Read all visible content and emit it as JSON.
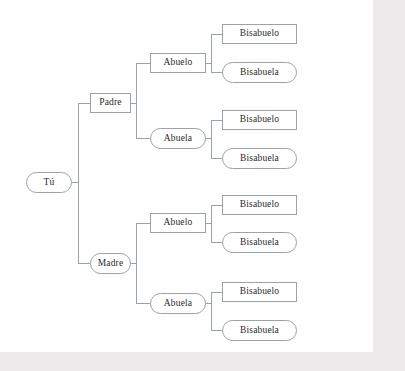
{
  "diagram": {
    "type": "family-tree",
    "language": "es",
    "orientation": "left-to-right",
    "generations": 4,
    "shape_legend": {
      "rectangle": "masculino",
      "stadium": "femenino"
    },
    "colors": {
      "page_background": "#fefefe",
      "outer_background": "#eceaea",
      "node_border": "#9aa3ac",
      "node_fill": "#ffffff",
      "edge": "#9aa3ac",
      "text": "#2b2b2b"
    }
  },
  "nodes": {
    "root": {
      "label": "Tú",
      "shape": "stadium",
      "gender": "neutral",
      "generation": 0
    },
    "padre": {
      "label": "Padre",
      "shape": "rectangle",
      "gender": "male",
      "generation": 1
    },
    "madre": {
      "label": "Madre",
      "shape": "stadium",
      "gender": "female",
      "generation": 1
    },
    "abuelo_paterno": {
      "label": "Abuelo",
      "shape": "rectangle",
      "gender": "male",
      "generation": 2
    },
    "abuela_paterna": {
      "label": "Abuela",
      "shape": "stadium",
      "gender": "female",
      "generation": 2
    },
    "abuelo_materno": {
      "label": "Abuelo",
      "shape": "rectangle",
      "gender": "male",
      "generation": 2
    },
    "abuela_materna": {
      "label": "Abuela",
      "shape": "stadium",
      "gender": "female",
      "generation": 2
    },
    "bisabuelo_1": {
      "label": "Bisabuelo",
      "shape": "rectangle",
      "gender": "male",
      "generation": 3
    },
    "bisabuela_1": {
      "label": "Bisabuela",
      "shape": "stadium",
      "gender": "female",
      "generation": 3
    },
    "bisabuelo_2": {
      "label": "Bisabuelo",
      "shape": "rectangle",
      "gender": "male",
      "generation": 3
    },
    "bisabuela_2": {
      "label": "Bisabuela",
      "shape": "stadium",
      "gender": "female",
      "generation": 3
    },
    "bisabuelo_3": {
      "label": "Bisabuelo",
      "shape": "rectangle",
      "gender": "male",
      "generation": 3
    },
    "bisabuela_3": {
      "label": "Bisabuela",
      "shape": "stadium",
      "gender": "female",
      "generation": 3
    },
    "bisabuelo_4": {
      "label": "Bisabuelo",
      "shape": "rectangle",
      "gender": "male",
      "generation": 3
    },
    "bisabuela_4": {
      "label": "Bisabuela",
      "shape": "stadium",
      "gender": "female",
      "generation": 3
    }
  },
  "edges": [
    {
      "from": "root",
      "to": "padre"
    },
    {
      "from": "root",
      "to": "madre"
    },
    {
      "from": "padre",
      "to": "abuelo_paterno"
    },
    {
      "from": "padre",
      "to": "abuela_paterna"
    },
    {
      "from": "madre",
      "to": "abuelo_materno"
    },
    {
      "from": "madre",
      "to": "abuela_materna"
    },
    {
      "from": "abuelo_paterno",
      "to": "bisabuelo_1"
    },
    {
      "from": "abuelo_paterno",
      "to": "bisabuela_1"
    },
    {
      "from": "abuela_paterna",
      "to": "bisabuelo_2"
    },
    {
      "from": "abuela_paterna",
      "to": "bisabuela_2"
    },
    {
      "from": "abuelo_materno",
      "to": "bisabuelo_3"
    },
    {
      "from": "abuelo_materno",
      "to": "bisabuela_3"
    },
    {
      "from": "abuela_materna",
      "to": "bisabuelo_4"
    },
    {
      "from": "abuela_materna",
      "to": "bisabuela_4"
    }
  ]
}
